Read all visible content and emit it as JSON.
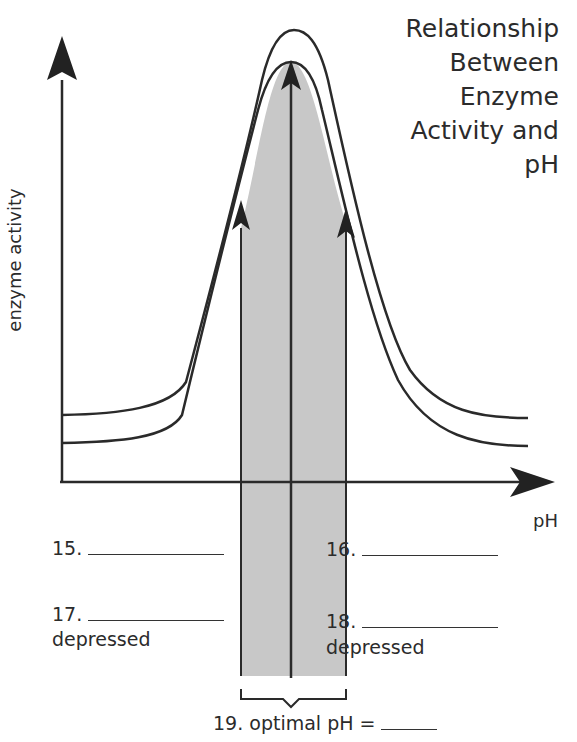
{
  "title": {
    "lines": [
      "Relationship",
      "Between",
      "Enzyme",
      "Activity and",
      "pH"
    ]
  },
  "axes": {
    "y_label": "enzyme activity",
    "x_label": "pH"
  },
  "questions": {
    "q15": {
      "number": "15.",
      "answer": ""
    },
    "q16": {
      "number": "16.",
      "answer": ""
    },
    "q17": {
      "number": "17.",
      "answer": "",
      "note": "depressed"
    },
    "q18": {
      "number": "18.",
      "answer": "",
      "note": "depressed"
    },
    "q19": {
      "text": "19. optimal pH =",
      "answer": ""
    }
  },
  "colors": {
    "line": "#2a2a2a",
    "shade": "#c8c8c8",
    "background": "#ffffff"
  }
}
